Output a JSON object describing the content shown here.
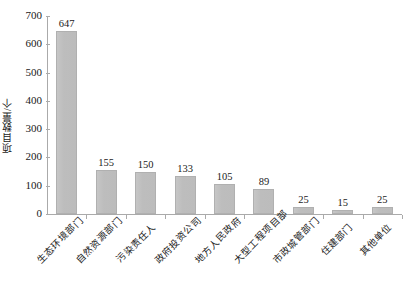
{
  "chart_data": {
    "type": "bar",
    "title": "",
    "subtitle": "",
    "xlabel": "",
    "ylabel": "项目数量/个",
    "ylim": [
      0,
      700
    ],
    "ytick_step": 100,
    "yticks": [
      0,
      100,
      200,
      300,
      400,
      500,
      600,
      700
    ],
    "ytick_labels": [
      "0",
      "100",
      "200",
      "300",
      "400",
      "500",
      "600",
      "700"
    ],
    "grid": false,
    "legend": false,
    "legend_position": "none",
    "bar_color": "#bfbfbf",
    "bar_edge_color": "#b0b0b0",
    "axis_color": "#aaaaaa",
    "data_labels_shown": true,
    "category_label_rotation": -45,
    "categories": [
      "生态环境部门",
      "自然资源部门",
      "污染责任人",
      "政府投资公司",
      "地方人民政府",
      "大型工程项目部",
      "市政城管部门",
      "住建部门",
      "其他单位"
    ],
    "values": [
      647,
      155,
      150,
      133,
      105,
      89,
      25,
      15,
      25
    ],
    "value_labels": [
      "647",
      "155",
      "150",
      "133",
      "105",
      "89",
      "25",
      "15",
      "25"
    ]
  }
}
